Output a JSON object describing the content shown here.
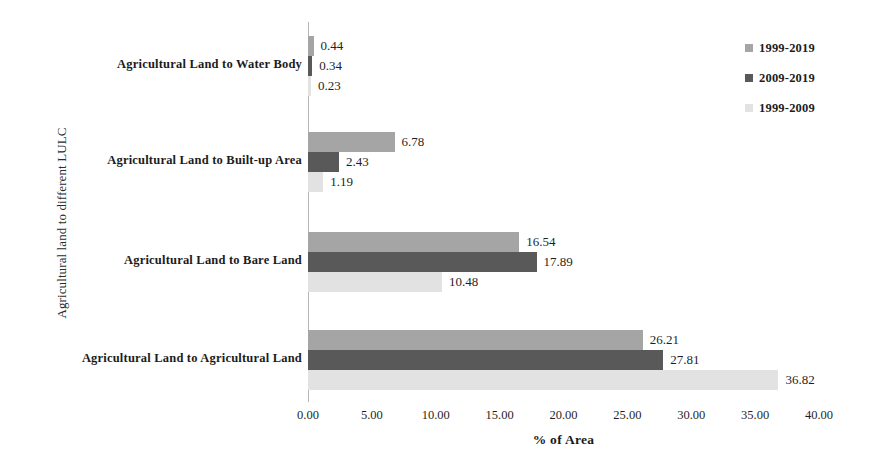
{
  "chart_data": {
    "type": "bar",
    "orientation": "horizontal",
    "title": "",
    "xlabel": "% of Area",
    "ylabel": "Agricultural land to different LULC",
    "xlim": [
      0,
      40
    ],
    "xticks": [
      "0.00",
      "5.00",
      "10.00",
      "15.00",
      "20.00",
      "25.00",
      "30.00",
      "35.00",
      "40.00"
    ],
    "xtick_values": [
      0,
      5,
      10,
      15,
      20,
      25,
      30,
      35,
      40
    ],
    "grid": false,
    "legend_position": "top-right",
    "categories": [
      "Agricultural Land to Water Body",
      "Agricultural Land to Built-up Area",
      "Agricultural Land to Bare Land",
      "Agricultural Land to Agricultural Land"
    ],
    "series": [
      {
        "name": "1999-2019",
        "color": "#a5a5a5",
        "values": [
          0.44,
          6.78,
          16.54,
          26.21
        ],
        "labels": [
          "0.44",
          "6.78",
          "16.54",
          "26.21"
        ]
      },
      {
        "name": "2009-2019",
        "color": "#595959",
        "values": [
          0.34,
          2.43,
          17.89,
          27.81
        ],
        "labels": [
          "0.34",
          "2.43",
          "17.89",
          "27.81"
        ]
      },
      {
        "name": "1999-2009",
        "color": "#e2e2e2",
        "values": [
          0.23,
          1.19,
          10.48,
          36.82
        ],
        "labels": [
          "0.23",
          "1.19",
          "10.48",
          "36.82"
        ]
      }
    ]
  },
  "legend": {
    "items": [
      {
        "label": "1999-2019",
        "color": "#a5a5a5"
      },
      {
        "label": "2009-2019",
        "color": "#595959"
      },
      {
        "label": "1999-2009",
        "color": "#e2e2e2"
      }
    ]
  }
}
